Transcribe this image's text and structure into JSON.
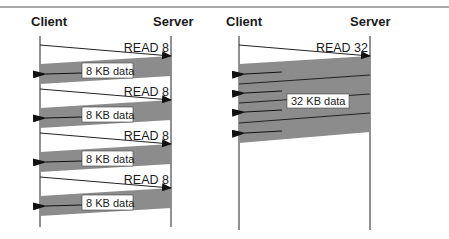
{
  "colors": {
    "band": "#8c8c8c",
    "line": "#222222",
    "rule": "#555555",
    "box": "#ffffff"
  },
  "left_diagram": {
    "client_label": "Client",
    "server_label": "Server",
    "cycles": [
      {
        "request": "READ 8",
        "response": "8 KB data"
      },
      {
        "request": "READ 8",
        "response": "8 KB data"
      },
      {
        "request": "READ 8",
        "response": "8 KB data"
      },
      {
        "request": "READ 8",
        "response": "8 KB data"
      }
    ]
  },
  "right_diagram": {
    "client_label": "Client",
    "server_label": "Server",
    "request": "READ 32",
    "response": "32 KB data",
    "response_packets": 4
  }
}
